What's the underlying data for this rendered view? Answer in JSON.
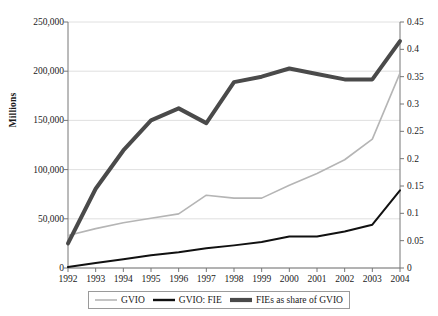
{
  "chart_data": {
    "type": "line",
    "title": "",
    "subtitle": "",
    "xlabel": "",
    "ylabel": "Millions",
    "ylabel_secondary": "",
    "categories": [
      "1992",
      "1993",
      "1994",
      "1995",
      "1996",
      "1997",
      "1998",
      "1999",
      "2000",
      "2001",
      "2002",
      "2003",
      "2004"
    ],
    "x": [
      1992,
      1993,
      1994,
      1995,
      1996,
      1997,
      1998,
      1999,
      2000,
      2001,
      2002,
      2003,
      2004
    ],
    "ylim": [
      0,
      250000
    ],
    "ylim_secondary": [
      0,
      0.45
    ],
    "yticks": [
      0,
      50000,
      100000,
      150000,
      200000,
      250000
    ],
    "ytick_labels": [
      "0",
      "50,000",
      "100,000",
      "150,000",
      "200,000",
      "250,000"
    ],
    "yticks_secondary": [
      0,
      0.05,
      0.1,
      0.15,
      0.2,
      0.25,
      0.3,
      0.35,
      0.4,
      0.45
    ],
    "ytick_labels_secondary": [
      "0",
      "0.05",
      "0.1",
      "0.15",
      "0.2",
      "0.25",
      "0.3",
      "0.35",
      "0.4",
      "0.45"
    ],
    "grid": true,
    "grid_color": "#d8d8d8",
    "legend_position": "bottom",
    "series": [
      {
        "name": "GVIO",
        "axis": "left",
        "color": "#b5b5b5",
        "width": 1.6,
        "values": [
          33000,
          40000,
          46000,
          50500,
          55000,
          74000,
          71000,
          71000,
          84000,
          96000,
          110000,
          131000,
          198000
        ]
      },
      {
        "name": "GVIO: FIE",
        "axis": "left",
        "color": "#111111",
        "width": 2.0,
        "values": [
          1000,
          5000,
          9000,
          13000,
          16000,
          20000,
          23000,
          26500,
          32000,
          32000,
          37000,
          44000,
          79000
        ]
      },
      {
        "name": "FIEs as share of GVIO",
        "axis": "right",
        "color": "#4a4a4a",
        "width": 4.0,
        "values": [
          0.045,
          0.145,
          0.215,
          0.27,
          0.292,
          0.265,
          0.34,
          0.35,
          0.365,
          0.355,
          0.345,
          0.345,
          0.415
        ]
      }
    ]
  },
  "legend": {
    "items": [
      {
        "label": "GVIO"
      },
      {
        "label": "GVIO: FIE"
      },
      {
        "label": "FIEs as share of GVIO"
      }
    ]
  }
}
